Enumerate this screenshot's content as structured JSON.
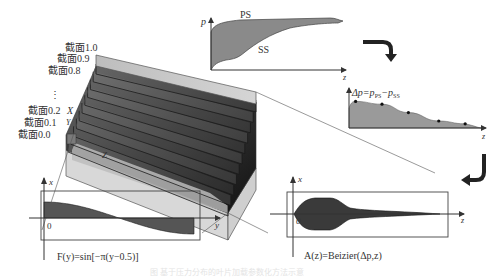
{
  "figure": {
    "caption": "图 基于压力分布的叶片加载参数化方法示意"
  },
  "block3d": {
    "section_labels": [
      "截面1.0",
      "截面0.9",
      "截面0.8",
      "⋮",
      "截面0.2",
      "截面0.1",
      "截面0.0"
    ],
    "axis_x_label": "X",
    "axis_y_label": "Y",
    "axis_z_label": "Z",
    "section_count": 11
  },
  "pressure_chart": {
    "y_label": "p",
    "x_label": "z",
    "ps_label": "PS",
    "ss_label": "SS",
    "fill_color": "#8a8a8a"
  },
  "delta_chart": {
    "label_prefix": "Δp=p",
    "label_sub1": "PS",
    "label_mid": "−p",
    "label_sub2": "SS",
    "x_label": "z",
    "fill_color": "#9a9a9a",
    "control_points": [
      {
        "z": 0.05,
        "dp": 0.95
      },
      {
        "z": 0.25,
        "dp": 0.85
      },
      {
        "z": 0.45,
        "dp": 0.55
      },
      {
        "z": 0.68,
        "dp": 0.25
      },
      {
        "z": 0.88,
        "dp": 0.15
      }
    ]
  },
  "sine_panel": {
    "x_label": "x",
    "y_label": "y",
    "origin_label": "0",
    "formula": "F(y)=sin[−π(y−0.5)]"
  },
  "bezier_panel": {
    "x_label": "x",
    "z_label": "z",
    "origin_label": "0",
    "formula": "A(z)=Beizier(Δp,z)"
  },
  "arrows": [
    {
      "name": "pressure-to-delta",
      "direction": "down"
    },
    {
      "name": "delta-to-bezier",
      "direction": "left"
    }
  ]
}
